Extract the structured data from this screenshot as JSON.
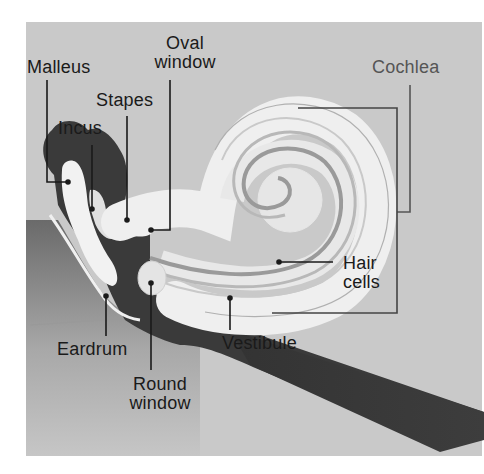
{
  "diagram": {
    "colors": {
      "background": "#c9c9c9",
      "bone_dark": "#3a3a3a",
      "membrane_light": "#eeeeee",
      "ear_canal_gradient_top": "#6a6a6a",
      "ear_canal_gradient_bottom": "#c4c4c4",
      "leader_line": "#1a1a1a"
    },
    "labels": {
      "oval_window": {
        "line1": "Oval",
        "line2": "window"
      },
      "malleus": "Malleus",
      "stapes": "Stapes",
      "incus": "Incus",
      "cochlea": "Cochlea",
      "hair_cells": {
        "line1": "Hair",
        "line2": "cells"
      },
      "vestibule": "Vestibule",
      "eardrum": "Eardrum",
      "round_window": {
        "line1": "Round",
        "line2": "window"
      }
    }
  }
}
